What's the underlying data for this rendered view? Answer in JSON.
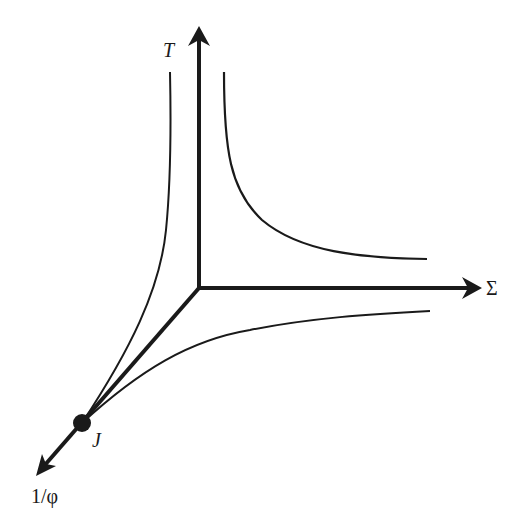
{
  "diagram": {
    "type": "3d-axes-phase-diagram",
    "axes": {
      "vertical": {
        "label": "T"
      },
      "horizontal": {
        "label": "Σ"
      },
      "diagonal": {
        "label": "1/φ"
      }
    },
    "point": {
      "label": "J"
    },
    "colors": {
      "ink": "#1a1a1a",
      "background": "#ffffff"
    },
    "curves": [
      {
        "name": "T-1/φ plane curve",
        "description": "from J rising to vertical asymptote left of T axis"
      },
      {
        "name": "T-Σ plane curve",
        "description": "hyperbola in T-Σ quadrant"
      },
      {
        "name": "Σ-1/φ plane curve",
        "description": "from J rising to horizontal asymptote below Σ axis"
      }
    ]
  }
}
